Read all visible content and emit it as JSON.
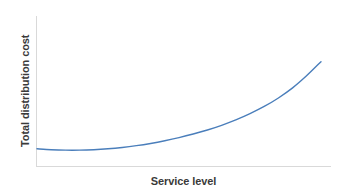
{
  "chart_data": {
    "type": "line",
    "title": "",
    "subtitle": "",
    "xlabel": "Service level",
    "ylabel": "Total distribution cost",
    "grid": false,
    "legend": false,
    "legend_position": "none",
    "axis_tick_labels": {
      "x": [],
      "y": []
    },
    "xlim": [
      0,
      100
    ],
    "ylim": [
      0,
      100
    ],
    "series": [
      {
        "name": "Total distribution cost",
        "color": "#4a7ebb",
        "line_width": 1.4,
        "x": [
          0,
          5,
          10,
          15,
          20,
          25,
          30,
          35,
          40,
          45,
          50,
          55,
          60,
          65,
          70,
          75,
          80,
          85,
          90,
          95,
          100
        ],
        "y": [
          8.2,
          7.4,
          7.0,
          7.0,
          7.4,
          8.2,
          9.4,
          11.0,
          13.0,
          15.4,
          18.2,
          21.4,
          25.0,
          29.2,
          34.0,
          39.6,
          46.0,
          53.6,
          62.6,
          73.6,
          86.0
        ]
      }
    ],
    "annotations": []
  },
  "colors": {
    "background": "#ffffff",
    "axis": "#d9d9d9",
    "curve": "#4a7ebb",
    "label_text": "#3a3a3a"
  },
  "axes": {
    "x_title": "Service level",
    "y_title": "Total distribution cost"
  }
}
